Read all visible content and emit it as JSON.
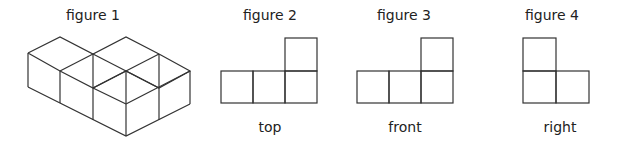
{
  "figures": [
    {
      "id": 1,
      "title": "figure 1",
      "caption": "",
      "view": "isometric"
    },
    {
      "id": 2,
      "title": "figure 2",
      "caption": "top",
      "view": "top"
    },
    {
      "id": 3,
      "title": "figure 3",
      "caption": "front",
      "view": "front"
    },
    {
      "id": 4,
      "title": "figure 4",
      "caption": "right",
      "view": "right"
    }
  ],
  "colors": {
    "line": "#333333",
    "background": "#ffffff",
    "text": "#222222"
  }
}
